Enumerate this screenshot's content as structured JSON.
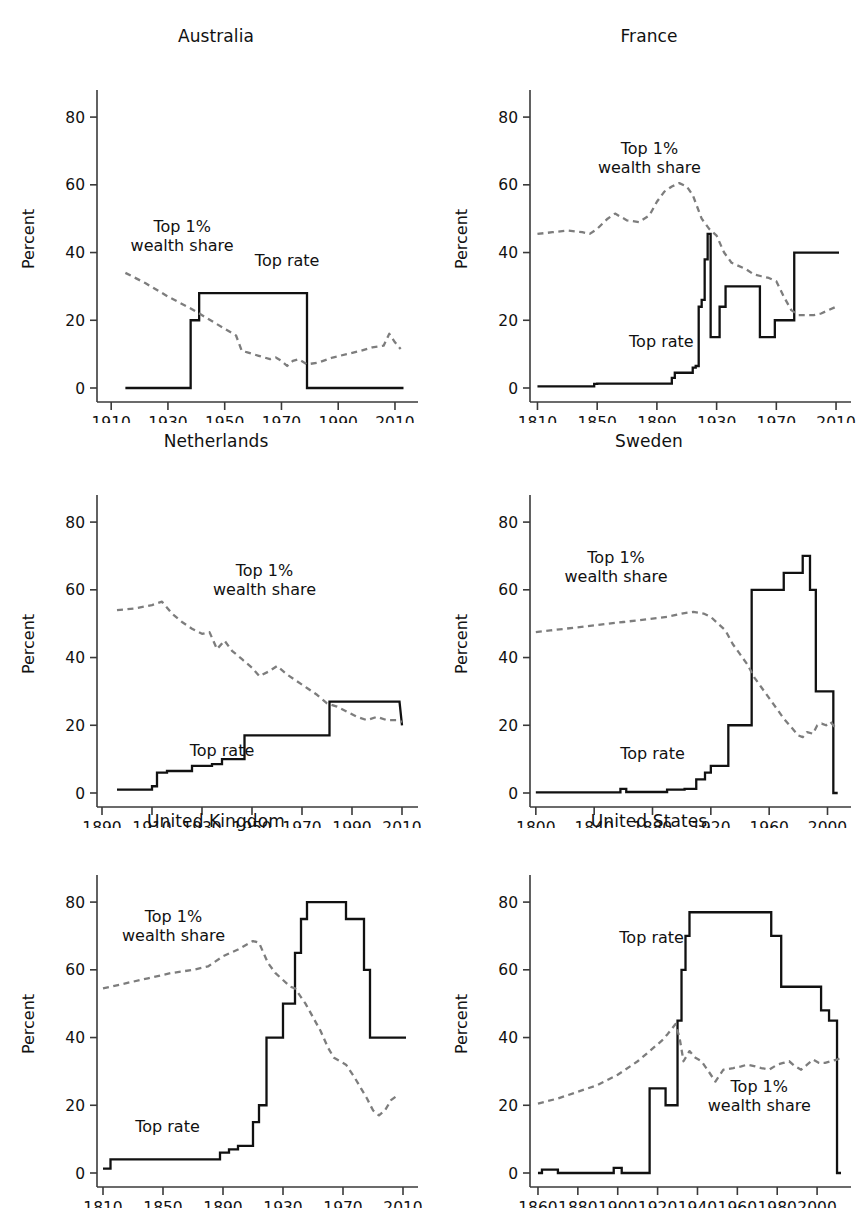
{
  "figure": {
    "ylabel": "Percent",
    "yticks": [
      0,
      20,
      40,
      60,
      80
    ],
    "ylim": [
      0,
      88
    ],
    "series_labels": {
      "toprate": "Top rate",
      "wealth_line1": "Top 1%",
      "wealth_line2": "wealth share"
    },
    "colors": {
      "toprate": "#111111",
      "wealth": "#7d7d7d",
      "axis": "#3a3a3a",
      "text": "#111111",
      "background": "#ffffff"
    }
  },
  "chart_data": [
    {
      "type": "line",
      "title": "Australia",
      "xlabel": "",
      "ylabel": "Percent",
      "xlim": [
        1905,
        2016
      ],
      "ylim": [
        0,
        88
      ],
      "xticks": [
        1910,
        1930,
        1950,
        1970,
        1990,
        2010
      ],
      "yticks": [
        0,
        20,
        40,
        60,
        80
      ],
      "grid": false,
      "legend": "inline-annotations",
      "annotations": [
        {
          "text": "Top 1%\nwealth share",
          "x": 1935,
          "y": 46
        },
        {
          "text": "Top rate",
          "x": 1972,
          "y": 36
        }
      ],
      "series": [
        {
          "name": "Top rate",
          "style": "solid-step",
          "x": [
            1915,
            1938,
            1938,
            1941,
            1941,
            1979,
            1979,
            2013
          ],
          "values": [
            0,
            0,
            20,
            20,
            28,
            28,
            0,
            0
          ]
        },
        {
          "name": "Top 1% wealth share",
          "style": "dashed",
          "x": [
            1915,
            1922,
            1930,
            1938,
            1945,
            1950,
            1954,
            1956,
            1958,
            1962,
            1966,
            1968,
            1970,
            1972,
            1974,
            1976,
            1979,
            1983,
            1988,
            1993,
            1998,
            2002,
            2006,
            2008,
            2010,
            2012
          ],
          "values": [
            34,
            31,
            27,
            23.5,
            20,
            17.5,
            15.5,
            11,
            10.5,
            9.5,
            8.5,
            9,
            8,
            6.5,
            8,
            8.5,
            7,
            7.5,
            9,
            10,
            11,
            12,
            12.5,
            16,
            13.5,
            11.5
          ]
        }
      ]
    },
    {
      "type": "line",
      "title": "France",
      "xlabel": "",
      "ylabel": "Percent",
      "xlim": [
        1805,
        2016
      ],
      "ylim": [
        0,
        88
      ],
      "xticks": [
        1810,
        1850,
        1890,
        1930,
        1970,
        2010
      ],
      "yticks": [
        0,
        20,
        40,
        60,
        80
      ],
      "grid": false,
      "legend": "inline-annotations",
      "annotations": [
        {
          "text": "Top 1%\nwealth share",
          "x": 1885,
          "y": 69
        },
        {
          "text": "Top rate",
          "x": 1893,
          "y": 12
        }
      ],
      "series": [
        {
          "name": "Top rate",
          "style": "solid-step",
          "x": [
            1810,
            1848,
            1848,
            1850,
            1850,
            1862,
            1862,
            1900,
            1900,
            1902,
            1902,
            1914,
            1914,
            1916,
            1916,
            1918,
            1918,
            1920,
            1920,
            1922,
            1922,
            1924,
            1924,
            1926,
            1926,
            1928,
            1928,
            1932,
            1932,
            1936,
            1936,
            1940,
            1940,
            1959,
            1959,
            1969,
            1969,
            1974,
            1974,
            1982,
            1982,
            2012
          ],
          "values": [
            0.5,
            0.5,
            1.2,
            1.2,
            1.3,
            1.3,
            1.3,
            1.3,
            3,
            3,
            4.5,
            4.5,
            6,
            6,
            6.5,
            6.5,
            24,
            24,
            26,
            26,
            38,
            38,
            45.5,
            45.5,
            15,
            15,
            15,
            15,
            24,
            24,
            30,
            30,
            30,
            30,
            15,
            15,
            20,
            20,
            20,
            20,
            40,
            40
          ]
        },
        {
          "name": "Top 1% wealth share",
          "style": "dashed",
          "x": [
            1810,
            1820,
            1830,
            1840,
            1845,
            1850,
            1857,
            1862,
            1870,
            1878,
            1885,
            1890,
            1895,
            1900,
            1905,
            1910,
            1914,
            1920,
            1925,
            1930,
            1935,
            1940,
            1950,
            1955,
            1960,
            1965,
            1970,
            1975,
            1980,
            1985,
            1990,
            1995,
            2000,
            2005,
            2010
          ],
          "values": [
            45.5,
            46,
            46.5,
            46,
            45.5,
            47,
            50,
            51.5,
            49.5,
            49,
            51,
            55,
            58,
            59.5,
            60.5,
            59.5,
            57,
            50,
            47,
            45,
            40,
            37,
            35,
            33.5,
            33,
            32.5,
            31.5,
            27,
            23,
            21.5,
            21.5,
            21.5,
            22,
            23,
            24
          ]
        }
      ]
    },
    {
      "type": "line",
      "title": "Netherlands",
      "xlabel": "",
      "ylabel": "Percent",
      "xlim": [
        1888,
        2014
      ],
      "ylim": [
        0,
        88
      ],
      "xticks": [
        1890,
        1910,
        1930,
        1950,
        1970,
        1990,
        2010
      ],
      "yticks": [
        0,
        20,
        40,
        60,
        80
      ],
      "grid": false,
      "legend": "inline-annotations",
      "annotations": [
        {
          "text": "Top 1%\nwealth share",
          "x": 1955,
          "y": 64
        },
        {
          "text": "Top rate",
          "x": 1938,
          "y": 11
        }
      ],
      "series": [
        {
          "name": "Top rate",
          "style": "solid-step",
          "x": [
            1896,
            1910,
            1910,
            1912,
            1912,
            1916,
            1916,
            1926,
            1926,
            1934,
            1934,
            1938,
            1938,
            1942,
            1942,
            1947,
            1947,
            1981,
            1981,
            2009,
            2009,
            2010
          ],
          "values": [
            1,
            1,
            2,
            2,
            6,
            6,
            6.5,
            6.5,
            8,
            8,
            8.5,
            8.5,
            10,
            10,
            10,
            10,
            17,
            17,
            27,
            27,
            27,
            20
          ]
        },
        {
          "name": "Top 1% wealth share",
          "style": "dashed",
          "x": [
            1896,
            1903,
            1910,
            1914,
            1918,
            1922,
            1926,
            1930,
            1933,
            1936,
            1939,
            1942,
            1946,
            1950,
            1953,
            1957,
            1960,
            1964,
            1968,
            1972,
            1976,
            1980,
            1984,
            1988,
            1992,
            1996,
            2000,
            2004,
            2008,
            2010
          ],
          "values": [
            54,
            54.5,
            55.5,
            56.5,
            53,
            50.5,
            48.5,
            47,
            47.5,
            42.5,
            45,
            42,
            39.5,
            37,
            34.5,
            36,
            37.5,
            35,
            33,
            31,
            29,
            26.5,
            25.5,
            24,
            22.5,
            21.5,
            22.5,
            21.5,
            21.5,
            21
          ]
        }
      ]
    },
    {
      "type": "line",
      "title": "Sweden",
      "xlabel": "",
      "ylabel": "Percent",
      "xlim": [
        1796,
        2012
      ],
      "ylim": [
        0,
        88
      ],
      "xticks": [
        1800,
        1840,
        1880,
        1920,
        1960,
        2000
      ],
      "yticks": [
        0,
        20,
        40,
        60,
        80
      ],
      "grid": false,
      "legend": "inline-annotations",
      "annotations": [
        {
          "text": "Top 1%\nwealth share",
          "x": 1855,
          "y": 68
        },
        {
          "text": "Top rate",
          "x": 1880,
          "y": 10
        }
      ],
      "series": [
        {
          "name": "Top rate",
          "style": "solid-step",
          "x": [
            1800,
            1858,
            1858,
            1862,
            1862,
            1890,
            1890,
            1902,
            1902,
            1910,
            1910,
            1916,
            1916,
            1920,
            1920,
            1924,
            1924,
            1932,
            1932,
            1938,
            1938,
            1948,
            1948,
            1970,
            1970,
            1983,
            1983,
            1988,
            1988,
            1992,
            1992,
            2004,
            2004,
            2007
          ],
          "values": [
            0.2,
            0.2,
            1.2,
            1.2,
            0.3,
            0.3,
            1,
            1,
            1.2,
            1.2,
            4,
            4,
            6,
            6,
            8,
            8,
            8,
            8,
            20,
            20,
            20,
            20,
            60,
            60,
            65,
            65,
            70,
            70,
            60,
            60,
            30,
            30,
            0,
            0
          ]
        },
        {
          "name": "Top 1% wealth share",
          "style": "dashed",
          "x": [
            1800,
            1810,
            1820,
            1830,
            1840,
            1850,
            1860,
            1870,
            1880,
            1890,
            1900,
            1908,
            1915,
            1920,
            1925,
            1930,
            1935,
            1940,
            1945,
            1950,
            1955,
            1960,
            1965,
            1970,
            1975,
            1980,
            1983,
            1986,
            1990,
            1993,
            1996,
            1999,
            2002,
            2005,
            2007
          ],
          "values": [
            47.5,
            48,
            48.5,
            49,
            49.5,
            50,
            50.5,
            51,
            51.5,
            52,
            53,
            53.5,
            53,
            52,
            50,
            48,
            44,
            41,
            38,
            34,
            31,
            28,
            25,
            22,
            19.5,
            17,
            16.5,
            18,
            17.5,
            20,
            20.5,
            20,
            21,
            19.5,
            19
          ]
        }
      ]
    },
    {
      "type": "line",
      "title": "United Kingdom",
      "xlabel": "",
      "ylabel": "Percent",
      "xlim": [
        1806,
        2016
      ],
      "ylim": [
        0,
        88
      ],
      "xticks": [
        1810,
        1850,
        1890,
        1930,
        1970,
        2010
      ],
      "yticks": [
        0,
        20,
        40,
        60,
        80
      ],
      "grid": false,
      "legend": "inline-annotations",
      "annotations": [
        {
          "text": "Top 1%\nwealth share",
          "x": 1857,
          "y": 74
        },
        {
          "text": "Top rate",
          "x": 1853,
          "y": 12
        }
      ],
      "series": [
        {
          "name": "Top rate",
          "style": "solid-step",
          "x": [
            1810,
            1815,
            1815,
            1881,
            1881,
            1888,
            1888,
            1894,
            1894,
            1900,
            1900,
            1907,
            1907,
            1910,
            1910,
            1914,
            1914,
            1919,
            1919,
            1925,
            1925,
            1930,
            1930,
            1934,
            1934,
            1938,
            1938,
            1942,
            1942,
            1946,
            1946,
            1964,
            1964,
            1972,
            1972,
            1975,
            1975,
            1984,
            1984,
            1988,
            1988,
            2012
          ],
          "values": [
            1.3,
            1.3,
            4,
            4,
            4,
            4,
            6,
            6,
            7,
            7,
            8,
            8,
            8,
            8,
            15,
            15,
            20,
            20,
            40,
            40,
            40,
            40,
            50,
            50,
            50,
            50,
            65,
            65,
            75,
            75,
            80,
            80,
            80,
            80,
            75,
            75,
            75,
            75,
            60,
            60,
            40,
            40
          ]
        },
        {
          "name": "Top 1% wealth share",
          "style": "dashed",
          "x": [
            1810,
            1825,
            1840,
            1855,
            1870,
            1880,
            1890,
            1900,
            1910,
            1914,
            1920,
            1925,
            1930,
            1935,
            1938,
            1945,
            1950,
            1955,
            1960,
            1964,
            1968,
            1972,
            1975,
            1978,
            1982,
            1986,
            1990,
            1994,
            1998,
            2002,
            2005
          ],
          "values": [
            54.5,
            56,
            57.5,
            59,
            60,
            61,
            64,
            66,
            68.5,
            68,
            62,
            59,
            57,
            55,
            54.5,
            50,
            46,
            42,
            37,
            34,
            33,
            32,
            30,
            28,
            25,
            22,
            18.5,
            17,
            18.5,
            21.5,
            22.5
          ]
        }
      ]
    },
    {
      "type": "line",
      "title": "United States",
      "xlabel": "",
      "ylabel": "Percent",
      "xlim": [
        1856,
        2014
      ],
      "ylim": [
        0,
        88
      ],
      "xticks": [
        1860,
        1880,
        1900,
        1920,
        1940,
        1960,
        1980,
        2000
      ],
      "yticks": [
        0,
        20,
        40,
        60,
        80
      ],
      "grid": false,
      "legend": "inline-annotations",
      "annotations": [
        {
          "text": "Top rate",
          "x": 1917,
          "y": 68
        },
        {
          "text": "Top 1%\nwealth share",
          "x": 1971,
          "y": 24
        }
      ],
      "series": [
        {
          "name": "Top rate",
          "style": "solid-step",
          "x": [
            1860,
            1862,
            1862,
            1870,
            1870,
            1898,
            1898,
            1902,
            1902,
            1916,
            1916,
            1918,
            1918,
            1924,
            1924,
            1926,
            1926,
            1930,
            1930,
            1932,
            1932,
            1934,
            1934,
            1936,
            1936,
            1940,
            1940,
            1977,
            1977,
            1982,
            1982,
            1984,
            1984,
            2002,
            2002,
            2006,
            2006,
            2010,
            2010,
            2012
          ],
          "values": [
            0,
            0,
            1,
            1,
            0,
            0,
            1.5,
            1.5,
            0,
            0,
            25,
            25,
            25,
            25,
            20,
            20,
            20,
            20,
            45,
            45,
            60,
            60,
            70,
            70,
            77,
            77,
            77,
            77,
            70,
            70,
            55,
            55,
            55,
            55,
            48,
            48,
            45,
            45,
            0,
            0
          ]
        },
        {
          "name": "Top 1% wealth share",
          "style": "dashed",
          "x": [
            1860,
            1870,
            1880,
            1890,
            1900,
            1910,
            1916,
            1922,
            1925,
            1929,
            1931,
            1933,
            1936,
            1939,
            1942,
            1945,
            1949,
            1953,
            1958,
            1962,
            1965,
            1969,
            1972,
            1976,
            1980,
            1983,
            1986,
            1989,
            1992,
            1995,
            1998,
            2001,
            2004,
            2007,
            2010,
            2012
          ],
          "values": [
            20.5,
            22,
            24,
            26,
            29,
            33,
            36,
            39,
            41,
            44,
            40,
            33,
            36,
            34,
            33,
            30.5,
            27,
            30.5,
            31,
            31.5,
            32,
            31.5,
            31,
            30.5,
            32,
            32.5,
            33,
            31.5,
            30.5,
            32,
            33.5,
            32.5,
            32.5,
            33,
            33.5,
            34
          ]
        }
      ]
    }
  ]
}
